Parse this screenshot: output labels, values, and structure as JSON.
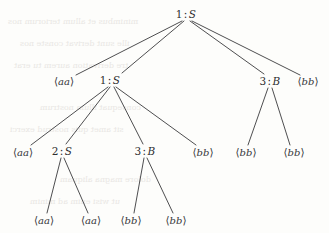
{
  "diagram": {
    "type": "derivation-tree",
    "background_color": "#fdfdfb",
    "ink_color": "#2e2e30",
    "edge_color": "#3a3a3c",
    "nodes": [
      {
        "id": "n0",
        "index": "1",
        "separator": ":",
        "symbol": "S",
        "kind": "nonterminal",
        "x": 186,
        "y": 14
      },
      {
        "id": "n1",
        "terminal": "aa",
        "kind": "terminal",
        "x": 64,
        "y": 81
      },
      {
        "id": "n2",
        "index": "1",
        "separator": ":",
        "symbol": "S",
        "kind": "nonterminal",
        "x": 110,
        "y": 80
      },
      {
        "id": "n3",
        "index": "3",
        "separator": ":",
        "symbol": "B",
        "kind": "nonterminal",
        "x": 270,
        "y": 81
      },
      {
        "id": "n4",
        "terminal": "bb",
        "kind": "terminal",
        "x": 308,
        "y": 81
      },
      {
        "id": "n5",
        "terminal": "aa",
        "kind": "terminal",
        "x": 23,
        "y": 152
      },
      {
        "id": "n6",
        "index": "2",
        "separator": ":",
        "symbol": "S",
        "kind": "nonterminal",
        "x": 62,
        "y": 151
      },
      {
        "id": "n7",
        "index": "3",
        "separator": ":",
        "symbol": "B",
        "kind": "nonterminal",
        "x": 145,
        "y": 151
      },
      {
        "id": "n8",
        "terminal": "bb",
        "kind": "terminal",
        "x": 203,
        "y": 152
      },
      {
        "id": "n9",
        "terminal": "bb",
        "kind": "terminal",
        "x": 246,
        "y": 152
      },
      {
        "id": "n10",
        "terminal": "bb",
        "kind": "terminal",
        "x": 294,
        "y": 152
      },
      {
        "id": "n11",
        "terminal": "aa",
        "kind": "terminal",
        "x": 44,
        "y": 220
      },
      {
        "id": "n12",
        "terminal": "aa",
        "kind": "terminal",
        "x": 91,
        "y": 220
      },
      {
        "id": "n13",
        "terminal": "bb",
        "kind": "terminal",
        "x": 131,
        "y": 220
      },
      {
        "id": "n14",
        "terminal": "bb",
        "kind": "terminal",
        "x": 176,
        "y": 220
      }
    ],
    "edges": [
      {
        "from": "n0",
        "to": "n1",
        "x1": 182,
        "y1": 21,
        "x2": 76,
        "y2": 75
      },
      {
        "from": "n0",
        "to": "n2",
        "x1": 184,
        "y1": 21,
        "x2": 122,
        "y2": 73
      },
      {
        "from": "n0",
        "to": "n3",
        "x1": 190,
        "y1": 21,
        "x2": 264,
        "y2": 74
      },
      {
        "from": "n0",
        "to": "n4",
        "x1": 192,
        "y1": 21,
        "x2": 300,
        "y2": 75
      },
      {
        "from": "n2",
        "to": "n5",
        "x1": 108,
        "y1": 87,
        "x2": 31,
        "y2": 145
      },
      {
        "from": "n2",
        "to": "n6",
        "x1": 110,
        "y1": 87,
        "x2": 66,
        "y2": 144
      },
      {
        "from": "n2",
        "to": "n7",
        "x1": 114,
        "y1": 87,
        "x2": 143,
        "y2": 144
      },
      {
        "from": "n2",
        "to": "n8",
        "x1": 116,
        "y1": 87,
        "x2": 196,
        "y2": 145
      },
      {
        "from": "n3",
        "to": "n9",
        "x1": 268,
        "y1": 88,
        "x2": 248,
        "y2": 145
      },
      {
        "from": "n3",
        "to": "n10",
        "x1": 272,
        "y1": 88,
        "x2": 290,
        "y2": 145
      },
      {
        "from": "n6",
        "to": "n11",
        "x1": 61,
        "y1": 158,
        "x2": 47,
        "y2": 213
      },
      {
        "from": "n6",
        "to": "n12",
        "x1": 64,
        "y1": 158,
        "x2": 88,
        "y2": 213
      },
      {
        "from": "n7",
        "to": "n13",
        "x1": 144,
        "y1": 158,
        "x2": 134,
        "y2": 213
      },
      {
        "from": "n7",
        "to": "n14",
        "x1": 147,
        "y1": 158,
        "x2": 173,
        "y2": 213
      }
    ],
    "bracket_open": "⟨",
    "bracket_close": "⟩"
  }
}
